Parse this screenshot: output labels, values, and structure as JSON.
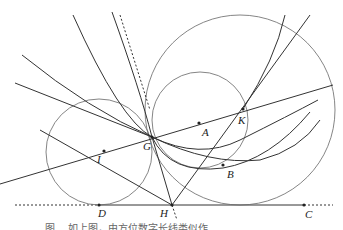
{
  "figure": {
    "points": {
      "A": {
        "label": "A",
        "x": 199,
        "y": 123
      },
      "B": {
        "label": "B",
        "x": 223,
        "y": 165
      },
      "C": {
        "label": "C",
        "x": 304,
        "y": 205
      },
      "D": {
        "label": "D",
        "x": 99,
        "y": 205
      },
      "G": {
        "label": "G",
        "x": 152,
        "y": 137
      },
      "H": {
        "label": "H",
        "x": 172,
        "y": 205
      },
      "I": {
        "label": "I",
        "x": 104,
        "y": 151
      },
      "K": {
        "label": "K",
        "x": 243,
        "y": 109
      }
    },
    "caption": "图 ... 如上图，由方位数字长线类似作…",
    "colors": {
      "line": "#333333",
      "circle": "#666666",
      "background": "#ffffff"
    }
  }
}
